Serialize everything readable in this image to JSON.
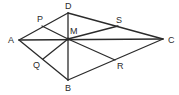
{
  "diagram": {
    "type": "geometry-figure",
    "points": {
      "A": {
        "label": "A",
        "x": 19,
        "y": 40
      },
      "D": {
        "label": "D",
        "x": 68,
        "y": 13
      },
      "C": {
        "label": "C",
        "x": 163,
        "y": 39
      },
      "B": {
        "label": "B",
        "x": 68,
        "y": 80
      },
      "M": {
        "label": "M",
        "x": 68,
        "y": 39
      },
      "P": {
        "label": "P",
        "x": 42,
        "y": 26
      },
      "Q": {
        "label": "Q",
        "x": 43,
        "y": 59
      },
      "S": {
        "label": "S",
        "x": 118,
        "y": 26
      },
      "R": {
        "label": "R",
        "x": 115,
        "y": 60
      }
    },
    "segments": [
      [
        "A",
        "D"
      ],
      [
        "D",
        "C"
      ],
      [
        "C",
        "B"
      ],
      [
        "B",
        "A"
      ],
      [
        "A",
        "C"
      ],
      [
        "D",
        "B"
      ],
      [
        "M",
        "P"
      ],
      [
        "M",
        "Q"
      ],
      [
        "M",
        "S"
      ],
      [
        "M",
        "R"
      ]
    ],
    "colors": {
      "line": "#2b2b2b",
      "background": "#ffffff"
    }
  }
}
